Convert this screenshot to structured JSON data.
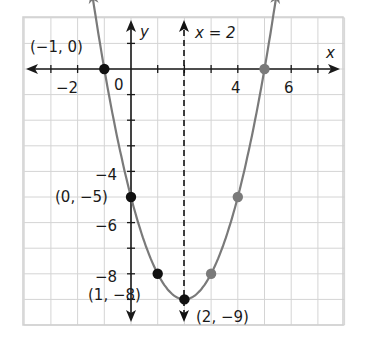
{
  "chart_data": {
    "type": "line",
    "title": "",
    "function": "y = x^2 - 4x - 5",
    "xlabel": "x",
    "ylabel": "y",
    "xlim": [
      -4,
      8
    ],
    "ylim": [
      -10,
      2
    ],
    "grid": true,
    "x_tick_labels": [
      {
        "value": -2,
        "label": "−2"
      },
      {
        "value": 0,
        "label": "0"
      },
      {
        "value": 4,
        "label": "4"
      },
      {
        "value": 6,
        "label": "6"
      }
    ],
    "y_tick_labels": [
      {
        "value": -4,
        "label": "−4"
      },
      {
        "value": -6,
        "label": "−6"
      },
      {
        "value": -8,
        "label": "−8"
      }
    ],
    "axis_of_symmetry": {
      "x": 2,
      "label": "x = 2"
    },
    "points_labeled": [
      {
        "x": -1,
        "y": 0,
        "label": "(−1, 0)",
        "color": "#111111"
      },
      {
        "x": 0,
        "y": -5,
        "label": "(0, −5)",
        "color": "#111111"
      },
      {
        "x": 1,
        "y": -8,
        "label": "(1, −8)",
        "color": "#111111"
      },
      {
        "x": 2,
        "y": -9,
        "label": "(2, −9)",
        "color": "#111111"
      }
    ],
    "points_reflected": [
      {
        "x": 3,
        "y": -8,
        "color": "#7a7a7a"
      },
      {
        "x": 4,
        "y": -5,
        "color": "#7a7a7a"
      },
      {
        "x": 5,
        "y": 0,
        "color": "#7a7a7a"
      }
    ],
    "curve": {
      "x": [
        -1.45,
        -1,
        0,
        1,
        2,
        3,
        4,
        5,
        5.45
      ],
      "y": [
        2.6,
        0,
        -5,
        -8,
        -9,
        -8,
        -5,
        0,
        2.6
      ],
      "color": "#7a7a7a"
    }
  },
  "labels": {
    "x_axis": "x",
    "y_axis": "y",
    "symmetry": "x = 2",
    "origin": "0",
    "xt_m2": "−2",
    "xt_4": "4",
    "xt_6": "6",
    "yt_m4": "−4",
    "yt_m6": "−6",
    "yt_m8": "−8",
    "p_m1_0": "(−1, 0)",
    "p_0_m5": "(0, −5)",
    "p_1_m8": "(1, −8)",
    "p_2_m9": "(2, −9)"
  }
}
